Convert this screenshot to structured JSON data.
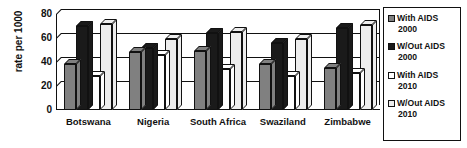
{
  "chart_data": {
    "type": "bar",
    "title": "",
    "xlabel": "",
    "ylabel": "rate per 1000",
    "ylim": [
      0,
      80
    ],
    "yticks": [
      0,
      20,
      40,
      60,
      80
    ],
    "grid": true,
    "legend_position": "right",
    "categories": [
      "Botswana",
      "Nigeria",
      "South Africa",
      "Swaziland",
      "Zimbabwe"
    ],
    "series": [
      {
        "name": "With AIDS 2000",
        "label_line1": "With AIDS",
        "label_line2": "2000",
        "color": "#808080",
        "values": [
          38,
          48,
          49,
          38,
          35
        ]
      },
      {
        "name": "W/Out AIDS 2000",
        "label_line1": "W/Out AIDS",
        "label_line2": "2000",
        "color": "#1a1a1a",
        "values": [
          70,
          52,
          64,
          56,
          68
        ]
      },
      {
        "name": "With AIDS 2010",
        "label_line1": "With AIDS",
        "label_line2": "2010",
        "color": "#ffffff",
        "values": [
          28,
          46,
          34,
          28,
          31
        ]
      },
      {
        "name": "W/Out AIDS 2010",
        "label_line1": "W/Out AIDS",
        "label_line2": "2010",
        "color": "#ededed",
        "values": [
          72,
          59,
          65,
          59,
          71
        ]
      }
    ]
  }
}
